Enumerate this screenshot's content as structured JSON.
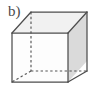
{
  "figure": {
    "label": "b)",
    "caption_text": "b)",
    "background_color": "#ffffff",
    "kind": "geometry-figure",
    "shape_name": "cube"
  },
  "cube": {
    "projection": "oblique",
    "stroke_color": "#4d4d4d",
    "hidden_stroke_color": "#555555",
    "stroke_width": 1.2,
    "hidden_dash_pattern": "2.4 2.4",
    "faces": {
      "front": {
        "name": "front-face",
        "fill": "#fdfdfd"
      },
      "top": {
        "name": "top-face",
        "fill": "#f2f2f2"
      },
      "right": {
        "name": "right-face",
        "fill": "#dcdcdc"
      }
    },
    "vertices": {
      "front_top_left": [
        12,
        33
      ],
      "front_top_right": [
        68,
        33
      ],
      "front_bottom_right": [
        68,
        82
      ],
      "front_bottom_left": [
        12,
        82
      ],
      "back_top_left": [
        31,
        12
      ],
      "back_top_right": [
        87,
        12
      ],
      "back_bottom_right": [
        87,
        61
      ],
      "back_bottom_left": [
        31,
        71
      ]
    },
    "hidden_edges": [
      "back_top_left -> back_bottom_left",
      "back_bottom_left -> back_bottom_right",
      "back_bottom_left -> front_bottom_left"
    ],
    "visible_edges": [
      "front_top_left -> front_top_right",
      "front_top_right -> front_bottom_right",
      "front_bottom_right -> front_bottom_left",
      "front_bottom_left -> front_top_left",
      "front_top_left -> back_top_left",
      "front_top_right -> back_top_right",
      "front_bottom_right -> back_bottom_right",
      "back_top_left -> back_top_right",
      "back_top_right -> back_bottom_right"
    ]
  }
}
